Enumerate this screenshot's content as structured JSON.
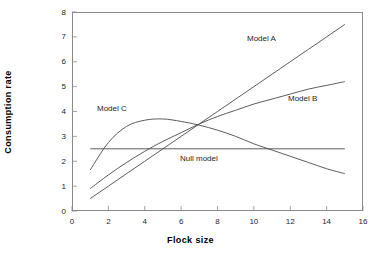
{
  "chart_data": {
    "type": "line",
    "title": "",
    "subtitle": "",
    "xlabel": "Flock size",
    "ylabel": "Consumption rate",
    "xlim": [
      0,
      16
    ],
    "ylim": [
      0,
      8
    ],
    "xticks": [
      0,
      2,
      4,
      6,
      8,
      10,
      12,
      14,
      16
    ],
    "yticks": [
      0,
      1,
      2,
      3,
      4,
      5,
      6,
      7,
      8
    ],
    "grid": false,
    "legend": "inline-annotations",
    "line_color": "#4a4a4a",
    "frame_color": "#8a8a8a",
    "series": [
      {
        "name": "Model A",
        "annotation": "Model A",
        "shape": "linear-increasing",
        "x": [
          1,
          2,
          3,
          4,
          5,
          6,
          7,
          8,
          9,
          10,
          11,
          12,
          13,
          14,
          15
        ],
        "values": [
          0.5,
          1.0,
          1.5,
          2.0,
          2.5,
          3.0,
          3.5,
          4.0,
          4.5,
          5.0,
          5.5,
          6.0,
          6.5,
          7.0,
          7.5
        ]
      },
      {
        "name": "Model B",
        "annotation": "Model B",
        "shape": "saturating-increasing",
        "x": [
          1,
          2,
          3,
          4,
          5,
          6,
          7,
          8,
          9,
          10,
          11,
          12,
          13,
          14,
          15
        ],
        "values": [
          0.9,
          1.45,
          1.95,
          2.4,
          2.8,
          3.15,
          3.5,
          3.8,
          4.05,
          4.3,
          4.5,
          4.7,
          4.9,
          5.05,
          5.2
        ]
      },
      {
        "name": "Model C",
        "annotation": "Model C",
        "shape": "dome-rise-then-decline",
        "x": [
          1,
          2,
          3,
          4,
          5,
          6,
          7,
          8,
          9,
          10,
          11,
          12,
          13,
          14,
          15
        ],
        "values": [
          1.65,
          2.75,
          3.4,
          3.65,
          3.7,
          3.6,
          3.45,
          3.25,
          3.0,
          2.7,
          2.45,
          2.2,
          1.95,
          1.7,
          1.5
        ]
      },
      {
        "name": "Null model",
        "annotation": "Null model",
        "shape": "horizontal-constant",
        "x": [
          1,
          15
        ],
        "values": [
          2.5,
          2.5
        ]
      }
    ]
  },
  "axis": {
    "x_title": "Flock size",
    "y_title": "Consumption rate",
    "x_tick_labels": [
      "0",
      "2",
      "4",
      "6",
      "8",
      "10",
      "12",
      "14",
      "16"
    ],
    "y_tick_labels": [
      "0",
      "1",
      "2",
      "3",
      "4",
      "5",
      "6",
      "7",
      "8"
    ]
  },
  "annotations": {
    "model_a": "Model A",
    "model_b": "Model B",
    "model_c": "Model C",
    "null_model": "Null model"
  }
}
